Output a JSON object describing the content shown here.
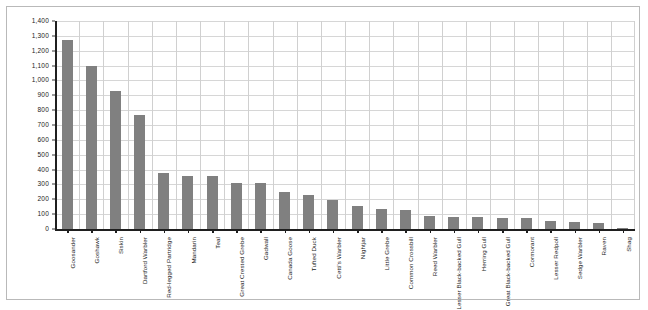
{
  "chart_data": {
    "type": "bar",
    "title": "",
    "xlabel": "",
    "ylabel": "",
    "ylim": [
      0,
      1400
    ],
    "ytick_step": 100,
    "grid": true,
    "legend": false,
    "bar_color": "#808080",
    "yticks": [
      "0",
      "100",
      "200",
      "300",
      "400",
      "500",
      "600",
      "700",
      "800",
      "900",
      "1,000",
      "1,100",
      "1,200",
      "1,300",
      "1,400"
    ],
    "ytick_values": [
      0,
      100,
      200,
      300,
      400,
      500,
      600,
      700,
      800,
      900,
      1000,
      1100,
      1200,
      1300,
      1400
    ],
    "categories": [
      "Goosander",
      "Goshawk",
      "Siskin",
      "Dartford Warbler",
      "Red-legged Partridge",
      "Mandarin",
      "Teal",
      "Great Crested Grebe",
      "Gadwall",
      "Canada Goose",
      "Tufted Duck",
      "Cetti's Warbler",
      "Nightjar",
      "Little Grebe",
      "Common Crossbill",
      "Reed Warbler",
      "Lesser Black-backed Gull",
      "Herring Gull",
      "Great Black-backed Gull",
      "Cormorant",
      "Lesser Redpoll",
      "Sedge Warbler",
      "Raven",
      "Shag"
    ],
    "values": [
      1275,
      1100,
      930,
      770,
      375,
      360,
      358,
      310,
      307,
      250,
      230,
      195,
      155,
      135,
      130,
      90,
      80,
      80,
      75,
      75,
      55,
      45,
      40,
      5
    ]
  }
}
